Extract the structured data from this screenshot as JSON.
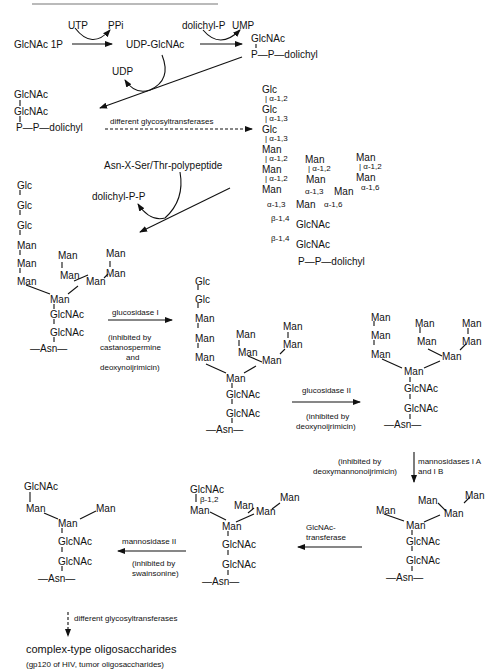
{
  "top_rule": true,
  "step1": {
    "substrate": "GlcNAc 1P",
    "cosubstrate_in": "UTP",
    "coproduct_out": "PPi",
    "product": "UDP-GlcNAc",
    "dolichyl_in": "dolichyl-P",
    "ump_out": "UMP",
    "lipid_glcnac": "GlcNAc",
    "lipid_pp": "P—P—dolichyl"
  },
  "step2": {
    "udp_out": "UDP",
    "chitobiose_1": "GlcNAc",
    "chitobiose_2": "GlcNAc",
    "chitobiose_pp": "P—P—dolichyl",
    "enzyme_label": "different glycosyltransferases"
  },
  "precursor": {
    "chain": [
      "Glc",
      "Glc",
      "Glc",
      "Man",
      "Man",
      "Man"
    ],
    "links": [
      "α-1,2",
      "α-1,3",
      "α-1,3",
      "α-1,2",
      "α-1,2"
    ],
    "mid_branch": [
      "Man",
      "Man"
    ],
    "mid_link": "α-1,2",
    "right_branch": [
      "Man",
      "Man"
    ],
    "right_link": "α-1,2",
    "branch_links": {
      "a13_left": "α-1,3",
      "a13_mid": "α-1,3",
      "a16_mid": "α-1,6",
      "a16_right": "α-1,6"
    },
    "mid_man": "Man",
    "core_man": "Man",
    "beta1": "β-1,4",
    "glcnac1": "GlcNAc",
    "beta2": "β-1,4",
    "glcnac2": "GlcNAc",
    "pp": "P—P—dolichyl"
  },
  "transfer": {
    "polypeptide": "Asn-X-Ser/Thr-polypeptide",
    "released": "dolichyl-P-P"
  },
  "protein_glycan": {
    "chain": [
      "Glc",
      "Glc",
      "Glc",
      "Man",
      "Man",
      "Man"
    ],
    "mid_branch": [
      "Man",
      "Man"
    ],
    "right_branch": [
      "Man",
      "Man"
    ],
    "core": [
      "Man",
      "GlcNAc",
      "GlcNAc"
    ],
    "asn": "—Asn—"
  },
  "glucosidase1": {
    "enzyme": "glucosidase I",
    "note": [
      "(inhibited by",
      "castanospermine",
      "and",
      "deoxynoijrimicin)"
    ]
  },
  "after_gluc1": {
    "chain": [
      "Glc",
      "Glc",
      "Man",
      "Man",
      "Man"
    ],
    "mid_branch": [
      "Man",
      "Man"
    ],
    "right_branch": [
      "Man",
      "Man"
    ],
    "core": [
      "Man",
      "GlcNAc",
      "GlcNAc"
    ],
    "asn": "—Asn—"
  },
  "glucosidase2": {
    "enzyme": "glucosidase II",
    "note": [
      "(inhibited by",
      "deoxynoijrimicin)"
    ]
  },
  "man9": {
    "chain": [
      "Man",
      "Man",
      "Man"
    ],
    "mid_branch": [
      "Man",
      "Man"
    ],
    "right_branch": [
      "Man",
      "Man"
    ],
    "core": [
      "Man",
      "GlcNAc",
      "GlcNAc"
    ],
    "asn": "—Asn—"
  },
  "mannosidase1": {
    "enzyme": [
      "mannosidases I A",
      "and I B"
    ],
    "note": [
      "(inhibited by",
      "deoxymannonoijrimicin)"
    ]
  },
  "man5": {
    "left": "Man",
    "mid": [
      "Man",
      "Man"
    ],
    "right": "Man",
    "core": [
      "Man",
      "GlcNAc",
      "GlcNAc"
    ],
    "asn": "—Asn—"
  },
  "glcnac_transferase": {
    "enzyme": [
      "GlcNAc-",
      "transferase"
    ]
  },
  "hybrid": {
    "glcnac": "GlcNAc",
    "beta": "β-1,2",
    "left": "Man",
    "mid": [
      "Man",
      "Man"
    ],
    "right": "Man",
    "core": [
      "Man",
      "GlcNAc",
      "GlcNAc"
    ],
    "asn": "—Asn—"
  },
  "mannosidase2": {
    "enzyme": "mannosidase II",
    "note": [
      "(inhibited by",
      "swainsonine)"
    ]
  },
  "trimmed": {
    "glcnac": "GlcNAc",
    "left": "Man",
    "right": "Man",
    "core": [
      "Man",
      "GlcNAc",
      "GlcNAc"
    ],
    "asn": "—Asn—"
  },
  "final": {
    "enzyme": "different glycosyltransferases",
    "product": "complex-type oligosaccharides",
    "examples": "(gp120 of HIV, tumor oligosaccharides)"
  }
}
